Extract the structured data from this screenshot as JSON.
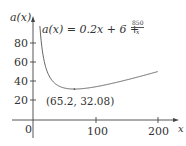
{
  "chart_data": {
    "type": "line",
    "title": "",
    "function_label": "a(x) = 0.2x + 6 + 850/x",
    "function_parts": {
      "lhs": "a(x) = 0.2x + 6 + ",
      "numerator": "850",
      "denominator": "x"
    },
    "xlabel": "x",
    "ylabel": "a(x)",
    "x_ticks": [
      100,
      200
    ],
    "y_ticks": [
      20,
      40,
      60,
      80
    ],
    "origin_label": "0",
    "xlim": [
      0,
      215
    ],
    "ylim": [
      0,
      95
    ],
    "grid": false,
    "legend": "none",
    "series": [
      {
        "name": "a(x)",
        "x": [
          9,
          12,
          15,
          20,
          25,
          30,
          40,
          50,
          65.2,
          80,
          100,
          125,
          150,
          175,
          200
        ],
        "values": [
          102.2,
          79.2,
          65.7,
          52.5,
          45.0,
          40.3,
          35.3,
          33.0,
          32.08,
          32.6,
          34.5,
          37.8,
          41.7,
          45.9,
          50.3
        ]
      }
    ],
    "annotations": [
      {
        "x": 65.2,
        "y": 32.08,
        "text": "(65.2, 32.08)"
      }
    ]
  },
  "colors": {
    "axis": "#444444",
    "curve": "#666666",
    "text": "#333333"
  }
}
